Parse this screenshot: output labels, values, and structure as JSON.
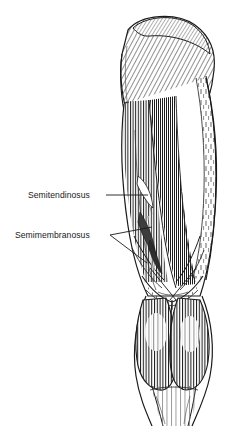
{
  "figure": {
    "kind": "anatomical-illustration",
    "view": "posterior view of right lower limb",
    "width": 234,
    "height": 428,
    "background_color": "#ffffff",
    "ink_color": "#1a1a1a",
    "shading_color": "#5a5a5a",
    "style": "black-and-white line engraving with hatching"
  },
  "labels": [
    {
      "id": "semitendinosus",
      "text": "Semitendinosus",
      "x": 28,
      "y": 190,
      "leader": {
        "type": "straight",
        "from_x": 106,
        "from_y": 195,
        "to_x": 148,
        "to_y": 195
      }
    },
    {
      "id": "semimembranosus",
      "text": "Semimembranosus",
      "x": 15,
      "y": 230,
      "leader": {
        "type": "forked",
        "from_x": 110,
        "from_y": 235,
        "branch_a_x": 152,
        "branch_a_y": 227,
        "branch_b_x": 147,
        "branch_b_y": 263
      }
    }
  ],
  "regions": [
    {
      "name": "gluteus-maximus",
      "hatching": "diagonal"
    },
    {
      "name": "iliotibial-band",
      "hatching": "dashed-vertical"
    },
    {
      "name": "biceps-femoris",
      "hatching": "vertical"
    },
    {
      "name": "semitendinosus-muscle",
      "hatching": "vertical"
    },
    {
      "name": "semimembranosus-muscle",
      "hatching": "vertical"
    },
    {
      "name": "popliteal-fossa",
      "hatching": "crossing-tendons"
    },
    {
      "name": "gastrocnemius-medial-head",
      "hatching": "vertical"
    },
    {
      "name": "gastrocnemius-lateral-head",
      "hatching": "vertical"
    },
    {
      "name": "achilles-tendon",
      "hatching": "sparse-vertical"
    }
  ]
}
